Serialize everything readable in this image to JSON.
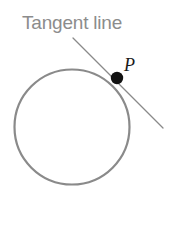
{
  "figure": {
    "background_color": "#ffffff",
    "width": 178,
    "height": 232
  },
  "labels": {
    "tangent_line": "Tangent line",
    "point": "P"
  },
  "colors": {
    "circle_stroke": "#8a8a8a",
    "tangent_stroke": "#8a8a8a",
    "point_fill": "#111111",
    "label_text": "#8c8c8c",
    "point_label_text": "#1a1a1a"
  },
  "geometry": {
    "circle": {
      "center_x": 72,
      "center_y": 127,
      "radius": 57.5,
      "stroke_width": 2.2
    },
    "tangent_line": {
      "x1": 73,
      "y1": 38,
      "x2": 163,
      "y2": 128,
      "stroke_width": 1.3
    },
    "tangent_point": {
      "cx": 117,
      "cy": 78,
      "r": 6.2
    }
  }
}
